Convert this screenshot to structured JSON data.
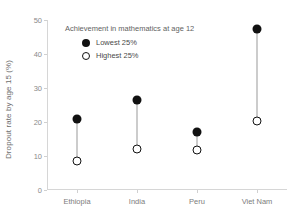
{
  "chart_data": {
    "type": "scatter",
    "title": "",
    "subtitle": "",
    "xlabel": "",
    "ylabel": "Dropout rate by age 15 (%)",
    "categories": [
      "Ethiopia",
      "India",
      "Peru",
      "Viet Nam"
    ],
    "ylim": [
      0,
      50
    ],
    "yticks": [
      0,
      10,
      20,
      30,
      40,
      50
    ],
    "ytick_labels": [
      "0",
      "10",
      "20",
      "30",
      "40",
      "50"
    ],
    "grid": false,
    "legend_position": "upper-left-inside",
    "legend_title": "Achievement in mathematics at age 12",
    "series": [
      {
        "name": "Lowest 25%",
        "marker": "filled-circle",
        "color": "#111111",
        "values": [
          21.0,
          26.5,
          17.0,
          47.5
        ]
      },
      {
        "name": "Highest 25%",
        "marker": "open-circle",
        "color": "#111111",
        "values": [
          8.5,
          12.0,
          11.8,
          20.3
        ]
      }
    ],
    "connector_color": "#9a9a9a"
  },
  "axis": {
    "spine_color": "#d6d6d6",
    "tick_color": "#d0d0d0",
    "tick_label_color": "#8a8a8a",
    "axis_title_color": "#6d6d6d"
  },
  "background": "#ffffff"
}
